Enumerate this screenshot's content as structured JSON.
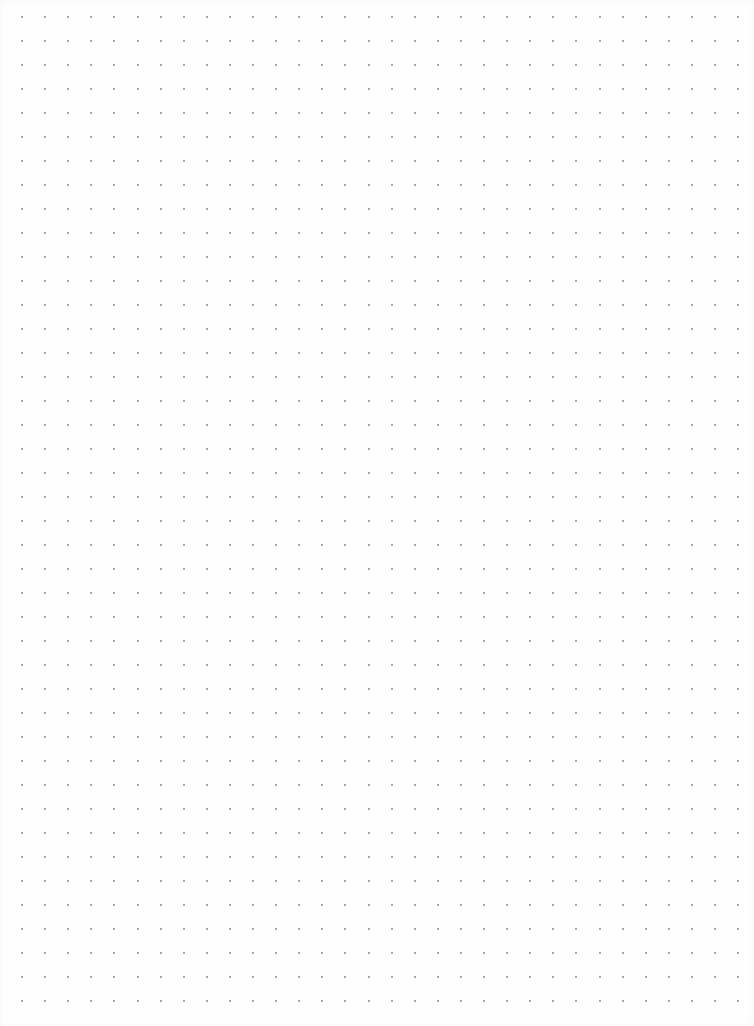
{
  "page": {
    "type": "dot-grid-paper",
    "background_color": "#fefefe",
    "dot_color": "#8a8a8a",
    "grid": {
      "origin_x": 22,
      "origin_y": 17,
      "spacing_x": 23.1,
      "spacing_y": 24,
      "columns": 32,
      "rows": 42
    }
  }
}
